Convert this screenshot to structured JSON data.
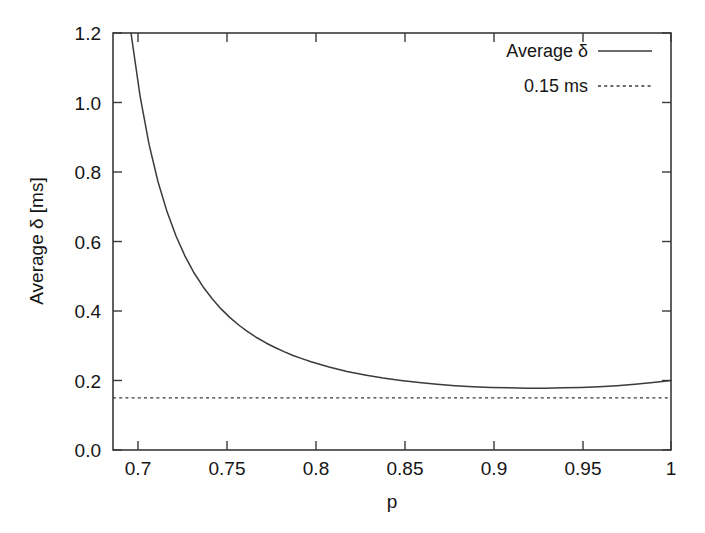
{
  "chart_data": {
    "type": "line",
    "title": "",
    "xlabel": "p",
    "ylabel": "Average δ [ms]",
    "xlim": [
      0.69,
      1.0
    ],
    "ylim": [
      0.0,
      1.2
    ],
    "grid": false,
    "legend_position": "top-right",
    "xticks": [
      "0.7",
      "0.75",
      "0.8",
      "0.85",
      "0.9",
      "0.95",
      "1"
    ],
    "xtick_values": [
      0.7,
      0.75,
      0.8,
      0.85,
      0.9,
      0.95,
      1.0
    ],
    "yticks": [
      "0.0",
      "0.2",
      "0.4",
      "0.6",
      "0.8",
      "1.0",
      "1.2"
    ],
    "ytick_values": [
      0.0,
      0.2,
      0.4,
      0.6,
      0.8,
      1.0,
      1.2
    ],
    "series": [
      {
        "name": "Average δ",
        "style": "solid",
        "color": "#3a3a3a",
        "x": [
          0.7,
          0.705,
          0.71,
          0.715,
          0.72,
          0.725,
          0.73,
          0.735,
          0.74,
          0.745,
          0.75,
          0.755,
          0.76,
          0.765,
          0.77,
          0.775,
          0.78,
          0.785,
          0.79,
          0.795,
          0.8,
          0.81,
          0.82,
          0.83,
          0.84,
          0.85,
          0.86,
          0.87,
          0.88,
          0.89,
          0.9,
          0.91,
          0.92,
          0.93,
          0.94,
          0.95,
          0.96,
          0.97,
          0.98,
          0.99,
          1.0
        ],
        "y": [
          1.2,
          1.02,
          0.88,
          0.772,
          0.686,
          0.616,
          0.558,
          0.51,
          0.47,
          0.436,
          0.406,
          0.381,
          0.359,
          0.34,
          0.323,
          0.308,
          0.295,
          0.283,
          0.272,
          0.263,
          0.254,
          0.239,
          0.226,
          0.216,
          0.207,
          0.2,
          0.194,
          0.189,
          0.185,
          0.182,
          0.18,
          0.179,
          0.178,
          0.178,
          0.179,
          0.18,
          0.182,
          0.185,
          0.189,
          0.194,
          0.2
        ]
      },
      {
        "name": "0.15 ms",
        "style": "dotted",
        "color": "#3a3a3a",
        "constant_y": 0.15
      }
    ],
    "annotations": {
      "minimum_approx_p": 0.88,
      "minimum_approx_y": 0.15,
      "threshold_value": 0.15
    }
  },
  "legend": {
    "entries": [
      {
        "label": "Average δ",
        "style": "solid"
      },
      {
        "label": "0.15 ms",
        "style": "dotted"
      }
    ]
  }
}
